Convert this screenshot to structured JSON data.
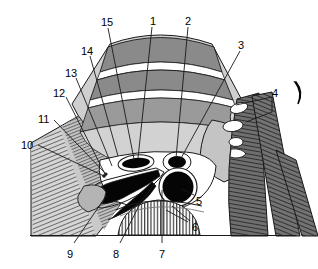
{
  "figure": {
    "kind": "anatomical-cross-section-diagram",
    "baseline_y": 235
  },
  "palette": {
    "background": "#ffffff",
    "outline": "#000000",
    "mid_gray": "#8a8a8a",
    "light_gray": "#c6c6c6",
    "pale_gray": "#d8d8d8",
    "dark_gray": "#6f6f6f",
    "black_fill": "#050505",
    "white_band": "#ffffff",
    "leader_line": "#1a1a1a"
  },
  "labels": [
    {
      "id": "label-15",
      "text": "15",
      "x": 101,
      "y": 17
    },
    {
      "id": "label-1",
      "text": "1",
      "x": 150,
      "y": 16
    },
    {
      "id": "label-2",
      "text": "2",
      "x": 185,
      "y": 16
    },
    {
      "id": "label-14",
      "text": "14",
      "x": 81,
      "y": 46
    },
    {
      "id": "label-3",
      "text": "3",
      "x": 238,
      "y": 40
    },
    {
      "id": "label-13",
      "text": "13",
      "x": 65,
      "y": 68
    },
    {
      "id": "label-4",
      "text": "4",
      "x": 272,
      "y": 88
    },
    {
      "id": "label-12",
      "text": "12",
      "x": 53,
      "y": 88
    },
    {
      "id": "label-11",
      "text": "11",
      "x": 38,
      "y": 114
    },
    {
      "id": "label-10",
      "text": "10",
      "x": 21,
      "y": 140
    },
    {
      "id": "label-5",
      "text": "5",
      "x": 196,
      "y": 196
    },
    {
      "id": "label-6",
      "text": "6",
      "x": 192,
      "y": 222
    },
    {
      "id": "label-9",
      "text": "9",
      "x": 67,
      "y": 249
    },
    {
      "id": "label-8",
      "text": "8",
      "x": 113,
      "y": 249
    },
    {
      "id": "label-7",
      "text": "7",
      "x": 159,
      "y": 249
    }
  ],
  "structures": [
    {
      "name": "upper-curved-band-outer",
      "kind": "tissue-layer",
      "tone": "mid_gray"
    },
    {
      "name": "upper-curved-band-inner",
      "kind": "tissue-layer",
      "tone": "mid_gray"
    },
    {
      "name": "white-separating-band",
      "kind": "fascial-plane",
      "tone": "white_band"
    },
    {
      "name": "left-hatched-muscle",
      "kind": "striated-muscle",
      "tone": "hatch-diagonal"
    },
    {
      "name": "right-striped-muscle",
      "kind": "striated-muscle",
      "tone": "dark_gray"
    },
    {
      "name": "vessel-oval-left",
      "kind": "vessel-lumen",
      "tone": "black_fill"
    },
    {
      "name": "vessel-oval-right",
      "kind": "vessel-lumen",
      "tone": "black_fill"
    },
    {
      "name": "large-vessel-circle",
      "kind": "vessel-lumen",
      "tone": "black_fill"
    },
    {
      "name": "curved-black-band",
      "kind": "vessel-lumen",
      "tone": "black_fill"
    },
    {
      "name": "lower-striped-dome",
      "kind": "striated-muscle",
      "tone": "hatch-vertical"
    },
    {
      "name": "baseline",
      "kind": "section-border",
      "tone": "outline"
    },
    {
      "name": "right-crescent-mark",
      "kind": "reference-marker",
      "tone": "black_fill"
    }
  ]
}
